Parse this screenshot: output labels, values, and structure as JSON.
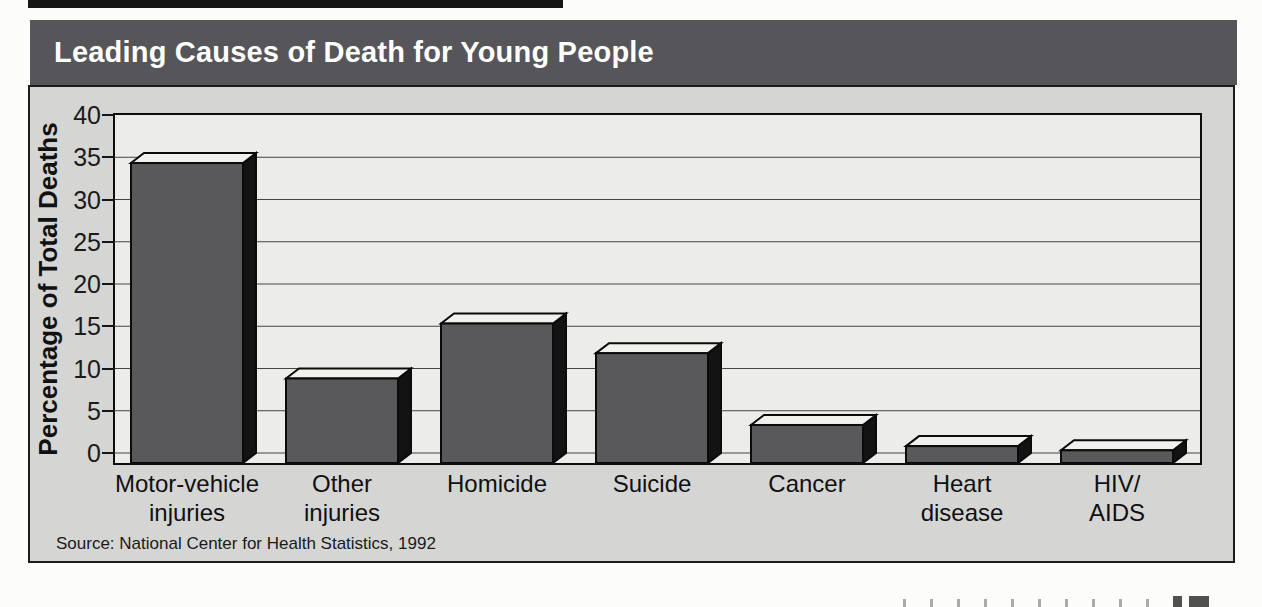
{
  "title_bar": {
    "title": "Leading Causes of Death for Young People",
    "bg_color": "#56565a",
    "text_color": "#ffffff"
  },
  "source_note": "Source: National Center for Health Statistics, 1992",
  "chart_data": {
    "type": "bar",
    "title": "Leading Causes of Death for Young People",
    "categories": [
      "Motor-vehicle injuries",
      "Other injuries",
      "Homicide",
      "Suicide",
      "Cancer",
      "Heart disease",
      "HIV/AIDS"
    ],
    "category_label_lines": [
      [
        "Motor-vehicle",
        "injuries"
      ],
      [
        "Other",
        "injuries"
      ],
      [
        "Homicide"
      ],
      [
        "Suicide"
      ],
      [
        "Cancer"
      ],
      [
        "Heart",
        "disease"
      ],
      [
        "HIV/",
        "AIDS"
      ]
    ],
    "values": [
      35.5,
      10,
      16.5,
      13,
      4.5,
      2,
      1.5
    ],
    "value_unit": "percent",
    "xlabel": "",
    "ylabel": "Percentage of Total Deaths",
    "yticks": [
      0,
      5,
      10,
      15,
      20,
      25,
      30,
      35,
      40
    ],
    "ylim": [
      0,
      40
    ],
    "grid": true,
    "legend": "none",
    "effect": "3d-block-bars",
    "source": "Source: National Center for Health Statistics, 1992",
    "colors": {
      "bar_front": "#59595c",
      "bar_top": "#f1f1ee",
      "bar_side": "#131313",
      "bar_outline": "#0b0b0b",
      "gridline": "#454545",
      "plot_bg": "#ececeb",
      "panel_bg": "#d5d5d4"
    }
  }
}
